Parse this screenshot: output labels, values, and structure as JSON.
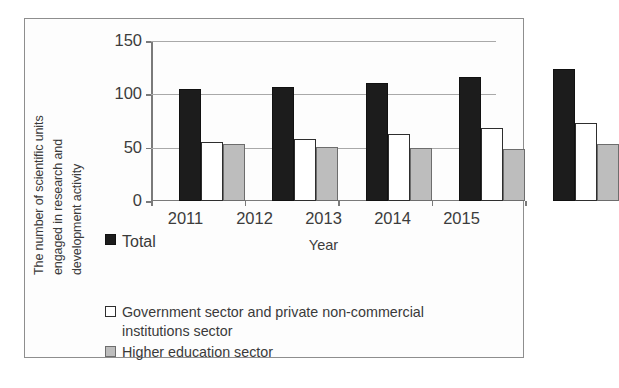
{
  "chart_data": {
    "type": "bar",
    "title": "",
    "categories": [
      "2011",
      "2012",
      "2013",
      "2014",
      "2015"
    ],
    "series": [
      {
        "name": "Total",
        "values": [
          105,
          107,
          111,
          116,
          124
        ],
        "color": "#1c1c1c"
      },
      {
        "name": "Government sector and private non-commercial institutions sector",
        "values": [
          55,
          58,
          63,
          68,
          73
        ],
        "color": "#ffffff"
      },
      {
        "name": "Higher education sector",
        "values": [
          53,
          51,
          50,
          49,
          53
        ],
        "color": "#bdbdbd"
      }
    ],
    "xlabel": "Year",
    "ylabel": "The number of scientific units engaged in research and development activity",
    "ylim": [
      0,
      150
    ],
    "yticks": [
      0,
      50,
      100,
      150
    ],
    "grid": true,
    "legend_position": "below"
  },
  "axes": {
    "y_title_lines": [
      "The number of scientific units",
      "engaged in research and",
      "development activity"
    ],
    "y_ticks": [
      "0",
      "50",
      "100",
      "150"
    ],
    "x_ticks": [
      "2011",
      "2012",
      "2013",
      "2014",
      "2015"
    ],
    "x_title": "Year"
  },
  "legend": {
    "items": [
      {
        "label": "Total",
        "swatch": "black-filled-square-icon"
      },
      {
        "label": "Government sector and private non-commercial institutions sector",
        "swatch": "white-outlined-square-icon"
      },
      {
        "label": "Higher education sector",
        "swatch": "gray-filled-square-icon"
      }
    ]
  }
}
